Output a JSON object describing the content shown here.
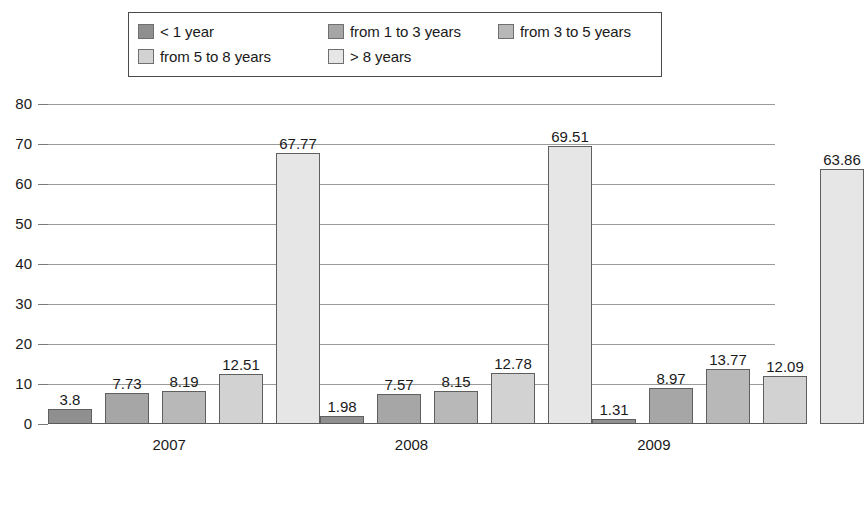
{
  "chart_data": {
    "type": "bar",
    "title": "",
    "xlabel": "",
    "ylabel": "",
    "categories": [
      "2007",
      "2008",
      "2009"
    ],
    "ylim": [
      0,
      80
    ],
    "yticks": [
      0,
      10,
      20,
      30,
      40,
      50,
      60,
      70,
      80
    ],
    "grid": true,
    "legend_position": "top",
    "series": [
      {
        "name": "< 1 year",
        "color": "#8f8f8f",
        "values": [
          3.8,
          1.98,
          1.31
        ],
        "labels": [
          "3.8",
          "1.98",
          "1.31"
        ]
      },
      {
        "name": "from 1 to 3 years",
        "color": "#a6a6a6",
        "values": [
          7.73,
          7.57,
          8.97
        ],
        "labels": [
          "7.73",
          "7.57",
          "8.97"
        ]
      },
      {
        "name": "from 3 to 5 years",
        "color": "#b8b8b8",
        "values": [
          8.19,
          8.15,
          13.77
        ],
        "labels": [
          "8.19",
          "8.15",
          "13.77"
        ]
      },
      {
        "name": "from 5 to 8 years",
        "color": "#d2d2d2",
        "values": [
          12.51,
          12.78,
          12.09
        ],
        "labels": [
          "12.51",
          "12.78",
          "12.09"
        ]
      },
      {
        "name": "> 8 years",
        "color": "#e6e6e6",
        "values": [
          67.77,
          69.51,
          63.86
        ],
        "labels": [
          "67.77",
          "69.51",
          "63.86"
        ]
      }
    ]
  }
}
